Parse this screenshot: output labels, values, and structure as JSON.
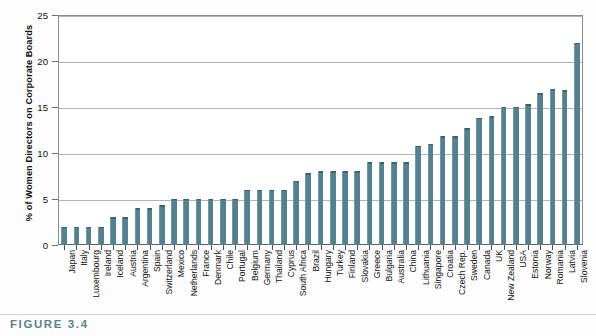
{
  "figure": {
    "caption": "FIGURE 3.4"
  },
  "chart_data": {
    "type": "bar",
    "title": "",
    "xlabel": "",
    "ylabel": "% of Women Directors on Corporate Boards",
    "ylim": [
      0,
      25
    ],
    "yticks": [
      0,
      5,
      10,
      15,
      20,
      25
    ],
    "ytick_labels": [
      "0",
      "5",
      "10",
      "15",
      "20",
      "25"
    ],
    "grid": "horizontal",
    "legend": "none",
    "bar_color": "#54808f",
    "categories": [
      "Japan",
      "Italy",
      "Luxembourg",
      "Ireland",
      "Iceland",
      "Austria",
      "Argentina",
      "Spain",
      "Switzerland",
      "Mexico",
      "Netherlands",
      "France",
      "Denmark",
      "Chile",
      "Portugal",
      "Belgium",
      "Germany",
      "Thailand",
      "Cyprus",
      "South Africa",
      "Brazil",
      "Hungary",
      "Turkey",
      "Finland",
      "Slovakia",
      "Greece",
      "Bulgaria",
      "Australia",
      "China",
      "Lithuania",
      "Singapore",
      "Croatia",
      "Czech Rep.",
      "Sweden",
      "Canada",
      "UK",
      "New Zealand",
      "USA",
      "Estonia",
      "Norway",
      "Romania",
      "Latvia",
      "Slovenia"
    ],
    "values": [
      2,
      2,
      2,
      2,
      3,
      3,
      4,
      4,
      4.3,
      5,
      5,
      5,
      5,
      5,
      5,
      6,
      6,
      6,
      6,
      7,
      7.8,
      8,
      8,
      8,
      8,
      9,
      9,
      9,
      9,
      10.8,
      11,
      11.8,
      11.8,
      12.7,
      13.8,
      14,
      15,
      15,
      15.3,
      16.5,
      17,
      16.8,
      22
    ]
  }
}
